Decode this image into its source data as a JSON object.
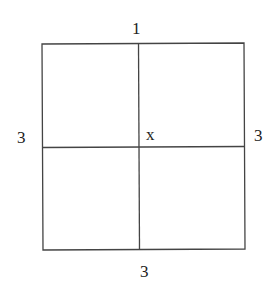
{
  "diagram": {
    "labels": {
      "top": "1",
      "left": "3",
      "right": "3",
      "bottom": "3",
      "center": "x"
    },
    "colors": {
      "line": "#444444",
      "text": "#222222",
      "background": "#ffffff"
    }
  }
}
